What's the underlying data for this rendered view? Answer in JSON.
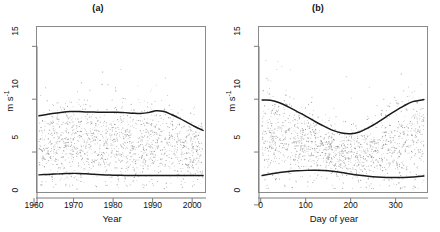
{
  "figure": {
    "background": "#ffffff",
    "point_color": "#8f8f8f",
    "curve_color": "#1a1a1a",
    "axis_color": "#8a8a8a"
  },
  "panels": [
    {
      "title": "(a)",
      "xlabel": "Year",
      "ylabel_main": "m s",
      "ylabel_sup": "-1",
      "xticks": [
        "1960",
        "1970",
        "1980",
        "1990",
        "2000"
      ],
      "xtick_values": [
        1960,
        1970,
        1980,
        1990,
        2000
      ],
      "yticks": [
        "0",
        "5",
        "10",
        "15"
      ],
      "ytick_values": [
        0,
        5,
        10,
        15
      ]
    },
    {
      "title": "(b)",
      "xlabel": "Day of year",
      "ylabel_main": "m s",
      "ylabel_sup": "-1",
      "xticks": [
        "0",
        "100",
        "200",
        "300"
      ],
      "xtick_values": [
        0,
        100,
        200,
        300
      ],
      "yticks": [
        "0",
        "5",
        "10",
        "15"
      ],
      "ytick_values": [
        0,
        5,
        10,
        15
      ]
    }
  ],
  "chart_data": [
    {
      "type": "scatter",
      "title": "(a)",
      "xlabel": "Year",
      "ylabel": "m s^-1",
      "xlim": [
        1960.5,
        2003.5
      ],
      "ylim": [
        -0.2,
        15.6
      ],
      "xticks": [
        1960,
        1970,
        1980,
        1990,
        2000
      ],
      "yticks": [
        0,
        5,
        10,
        15
      ],
      "grid": false,
      "legend": "none",
      "point_count_approx": 1300,
      "series": [
        {
          "name": "upper quantile smooth",
          "type": "line",
          "x": [
            1961,
            1963,
            1965,
            1967,
            1969,
            1971,
            1973,
            1975,
            1977,
            1979,
            1981,
            1983,
            1985,
            1987,
            1989,
            1991,
            1993,
            1995,
            1997,
            1999,
            2001,
            2003
          ],
          "y": [
            7.1,
            7.22,
            7.34,
            7.44,
            7.5,
            7.5,
            7.47,
            7.45,
            7.44,
            7.44,
            7.43,
            7.4,
            7.35,
            7.32,
            7.4,
            7.58,
            7.5,
            7.2,
            6.85,
            6.45,
            6.05,
            5.7
          ]
        },
        {
          "name": "lower quantile smooth",
          "type": "line",
          "x": [
            1961,
            1963,
            1965,
            1967,
            1969,
            1971,
            1973,
            1975,
            1977,
            1979,
            1981,
            1983,
            1985,
            1987,
            1989,
            1991,
            1993,
            1995,
            1997,
            1999,
            2001,
            2003
          ],
          "y": [
            1.44,
            1.48,
            1.52,
            1.55,
            1.58,
            1.58,
            1.54,
            1.49,
            1.45,
            1.42,
            1.4,
            1.39,
            1.38,
            1.38,
            1.38,
            1.38,
            1.38,
            1.38,
            1.38,
            1.38,
            1.38,
            1.38
          ]
        },
        {
          "name": "observations",
          "type": "scatter",
          "description": "Dense grey cloud of daily wind speed values spanning 1961-2003, bulk between 1 and 7 m s^-1, sparse outliers up to 15 m s^-1"
        }
      ]
    },
    {
      "type": "scatter",
      "title": "(b)",
      "xlabel": "Day of year",
      "ylabel": "m s^-1",
      "xlim": [
        -6,
        372
      ],
      "ylim": [
        -0.2,
        15.6
      ],
      "xticks": [
        0,
        100,
        200,
        300
      ],
      "yticks": [
        0,
        5,
        10,
        15
      ],
      "grid": false,
      "legend": "none",
      "point_count_approx": 1300,
      "series": [
        {
          "name": "upper quantile smooth",
          "type": "line",
          "x": [
            1,
            20,
            40,
            60,
            80,
            100,
            120,
            140,
            160,
            180,
            200,
            220,
            240,
            260,
            280,
            300,
            320,
            340,
            365
          ],
          "y": [
            8.6,
            8.58,
            8.35,
            7.95,
            7.5,
            7.05,
            6.55,
            6.1,
            5.7,
            5.45,
            5.38,
            5.55,
            5.95,
            6.45,
            7.0,
            7.55,
            8.05,
            8.45,
            8.65
          ]
        },
        {
          "name": "lower quantile smooth",
          "type": "line",
          "x": [
            1,
            20,
            40,
            60,
            80,
            100,
            120,
            140,
            160,
            180,
            200,
            220,
            240,
            260,
            280,
            300,
            320,
            340,
            365
          ],
          "y": [
            1.38,
            1.52,
            1.66,
            1.76,
            1.83,
            1.87,
            1.88,
            1.86,
            1.78,
            1.66,
            1.52,
            1.4,
            1.3,
            1.23,
            1.19,
            1.18,
            1.19,
            1.23,
            1.33
          ]
        },
        {
          "name": "observations",
          "type": "scatter",
          "description": "Dense grey cloud of daily wind speed values across day of year 1-365, seasonal envelope wider in winter, sparse outliers up to 15 m s^-1"
        }
      ]
    }
  ]
}
